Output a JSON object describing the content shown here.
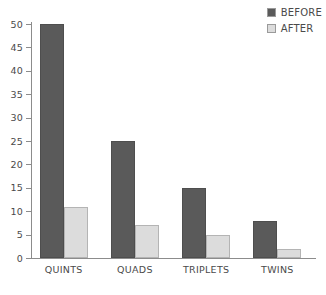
{
  "chart_data": {
    "type": "bar",
    "title": "",
    "subtitle": "",
    "xlabel": "",
    "ylabel": "",
    "categories": [
      "QUINTS",
      "QUADS",
      "TRIPLETS",
      "TWINS"
    ],
    "series": [
      {
        "name": "BEFORE",
        "values": [
          50,
          25,
          15,
          8
        ],
        "color": "#5a5a5a"
      },
      {
        "name": "AFTER",
        "values": [
          11,
          7,
          5,
          2
        ],
        "color": "#dcdcdc"
      }
    ],
    "ylim": [
      0,
      50
    ],
    "ytick_values": [
      0,
      5,
      10,
      15,
      20,
      25,
      30,
      35,
      40,
      45,
      50
    ],
    "ytick_labels": [
      "0",
      "5",
      "10",
      "15",
      "20",
      "25",
      "30",
      "35",
      "40",
      "45",
      "50"
    ],
    "grid": false,
    "legend_position": "top-right",
    "bar_grouping": "adjacent"
  },
  "legend": {
    "entries": [
      {
        "label": "BEFORE",
        "color": "#5a5a5a"
      },
      {
        "label": "AFTER",
        "color": "#dcdcdc"
      }
    ]
  },
  "axes": {
    "y_axis_color": "#8c8c8c",
    "x_axis_color": "#8c8c8c",
    "tick_label_color": "#4a4a4a"
  },
  "colors": {
    "before": "#5a5a5a",
    "after": "#dcdcdc",
    "before_border": "#4e4e4e",
    "after_border": "#b4b4b4",
    "background": "#ffffff"
  }
}
